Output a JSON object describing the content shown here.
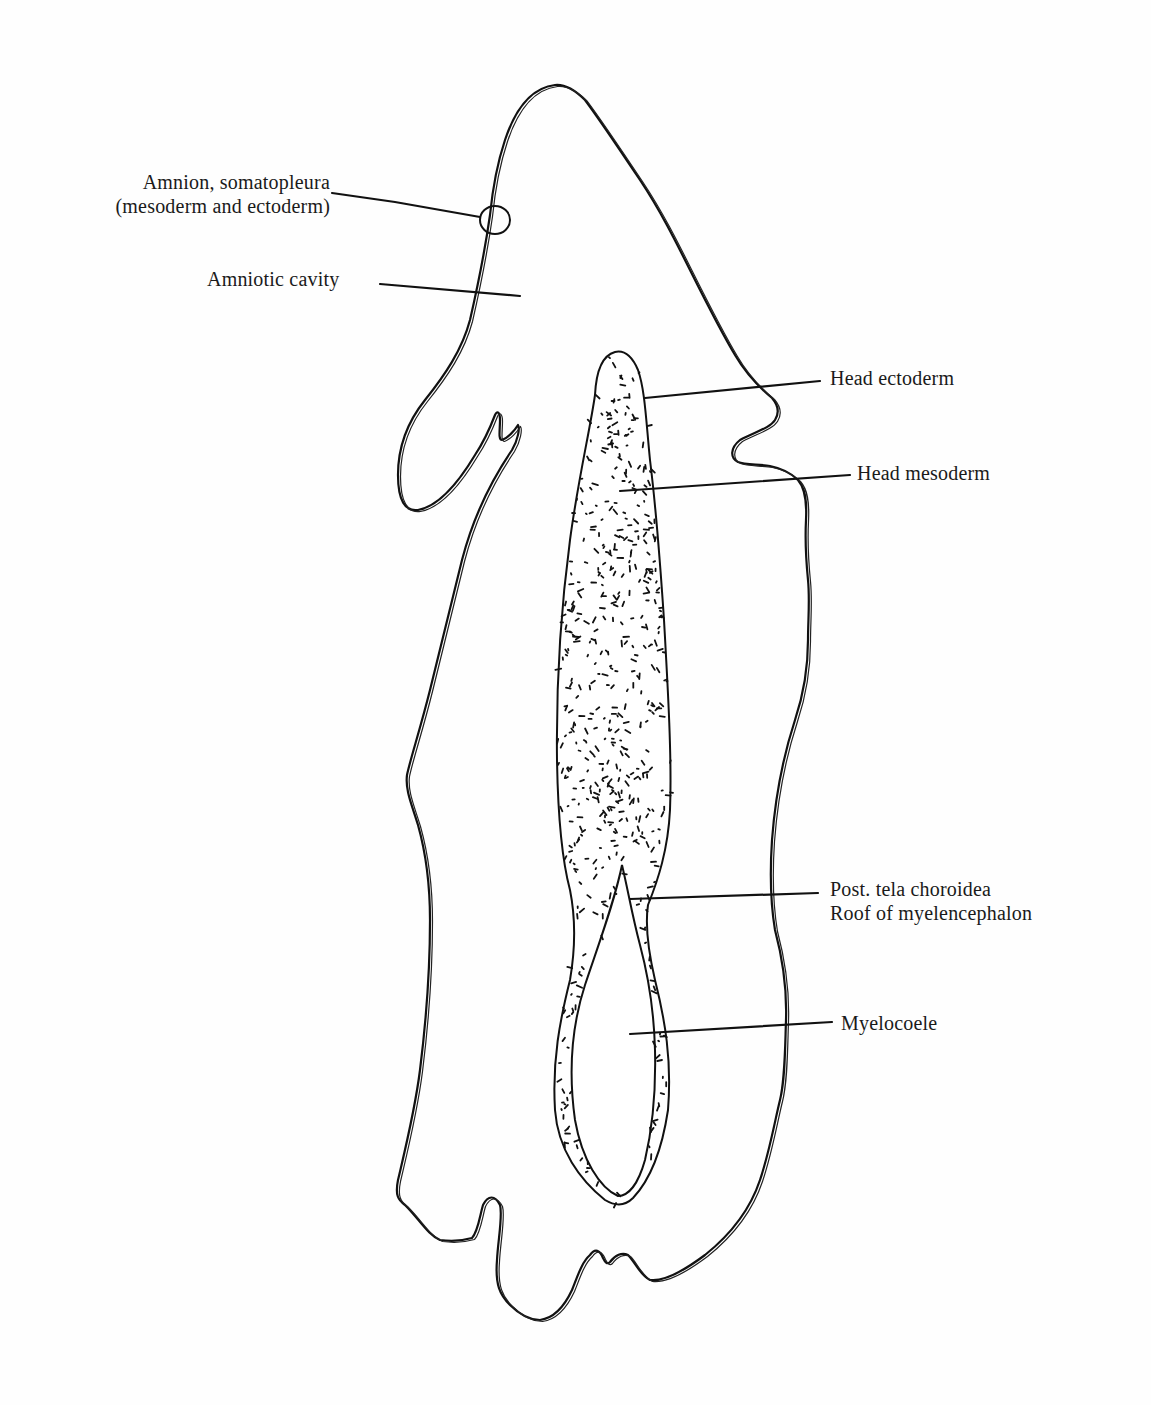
{
  "figure": {
    "ink_color": "#111111",
    "paper_color": "#fefefe"
  },
  "labels": {
    "amnion_line1": "Amnion, somatopleura",
    "amnion_line2": "(mesoderm and ectoderm)",
    "amniotic_cavity": "Amniotic cavity",
    "head_ectoderm": "Head ectoderm",
    "head_mesoderm": "Head mesoderm",
    "post_tela_line1": "Post. tela choroidea",
    "post_tela_line2": "Roof of myelencephalon",
    "myelocoele": "Myelocoele"
  }
}
